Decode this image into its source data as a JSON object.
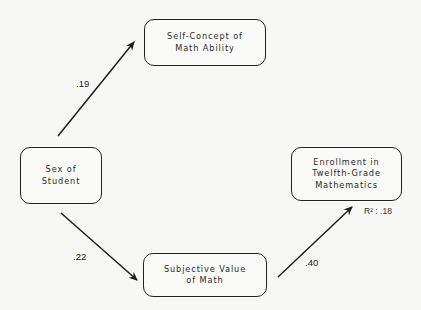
{
  "diagram": {
    "type": "path-model",
    "nodes": [
      {
        "id": "self_concept",
        "lines": [
          "Self-Concept of",
          "Math Ability"
        ]
      },
      {
        "id": "sex",
        "lines": [
          "Sex of",
          "Student"
        ]
      },
      {
        "id": "subjective_value",
        "lines": [
          "Subjective Value",
          "of Math"
        ]
      },
      {
        "id": "enrollment",
        "lines": [
          "Enrollment in",
          "Twelfth-Grade",
          "Mathematics"
        ]
      }
    ],
    "edges": [
      {
        "from": "sex",
        "to": "self_concept",
        "coefficient": ".19"
      },
      {
        "from": "sex",
        "to": "subjective_value",
        "coefficient": ".22"
      },
      {
        "from": "subjective_value",
        "to": "enrollment",
        "coefficient": ".40"
      }
    ],
    "annotations": {
      "enrollment_r2": "R² : .18"
    }
  }
}
